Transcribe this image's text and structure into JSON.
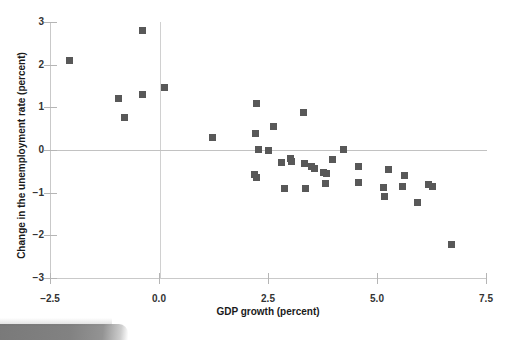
{
  "chart_data": {
    "type": "scatter",
    "title": "",
    "xlabel": "GDP growth (percent)",
    "ylabel": "Change in the unemployment rate (percent)",
    "xlim": [
      -2.5,
      7.5
    ],
    "ylim": [
      -3,
      3
    ],
    "xticks": [
      "-2.5",
      "0.0",
      "2.5",
      "5.0",
      "7.5"
    ],
    "xtick_values": [
      -2.5,
      0.0,
      2.5,
      5.0,
      7.5
    ],
    "yticks": [
      "3",
      "2",
      "1",
      "0",
      "-1",
      "-2",
      "-3"
    ],
    "ytick_values": [
      3,
      2,
      1,
      0,
      -1,
      -2,
      -3
    ],
    "grid": false,
    "legend": "none",
    "marker_color": "#585858",
    "marker_shape": "square",
    "reference_lines": [
      {
        "orientation": "horizontal",
        "value": 0
      },
      {
        "orientation": "vertical",
        "value": 0
      }
    ],
    "points": [
      {
        "x": -2.05,
        "y": 2.1
      },
      {
        "x": -0.93,
        "y": 1.21
      },
      {
        "x": -0.8,
        "y": 0.76
      },
      {
        "x": -0.38,
        "y": 2.79
      },
      {
        "x": -0.37,
        "y": 1.31
      },
      {
        "x": 0.13,
        "y": 1.47
      },
      {
        "x": 1.22,
        "y": 0.29
      },
      {
        "x": 2.23,
        "y": 1.1
      },
      {
        "x": 2.22,
        "y": 0.38
      },
      {
        "x": 2.28,
        "y": 0.02
      },
      {
        "x": 2.2,
        "y": -0.58
      },
      {
        "x": 2.23,
        "y": -0.65
      },
      {
        "x": 2.5,
        "y": -0.02
      },
      {
        "x": 2.63,
        "y": 0.56
      },
      {
        "x": 2.8,
        "y": -0.3
      },
      {
        "x": 2.88,
        "y": -0.9
      },
      {
        "x": 3.02,
        "y": -0.2
      },
      {
        "x": 3.05,
        "y": -0.27
      },
      {
        "x": 3.32,
        "y": 0.89
      },
      {
        "x": 3.33,
        "y": -0.31
      },
      {
        "x": 3.35,
        "y": -0.9
      },
      {
        "x": 3.5,
        "y": -0.38
      },
      {
        "x": 3.56,
        "y": -0.43
      },
      {
        "x": 3.78,
        "y": -0.52
      },
      {
        "x": 3.85,
        "y": -0.56
      },
      {
        "x": 3.83,
        "y": -0.78
      },
      {
        "x": 3.98,
        "y": -0.22
      },
      {
        "x": 4.23,
        "y": 0.01
      },
      {
        "x": 4.57,
        "y": -0.39
      },
      {
        "x": 4.58,
        "y": -0.76
      },
      {
        "x": 5.15,
        "y": -0.88
      },
      {
        "x": 5.17,
        "y": -1.09
      },
      {
        "x": 5.27,
        "y": -0.46
      },
      {
        "x": 5.58,
        "y": -0.86
      },
      {
        "x": 5.63,
        "y": -0.6
      },
      {
        "x": 5.92,
        "y": -1.24
      },
      {
        "x": 6.18,
        "y": -0.8
      },
      {
        "x": 6.28,
        "y": -0.86
      },
      {
        "x": 6.72,
        "y": -2.21
      }
    ]
  },
  "figure": {
    "artifact_label": "scan-edge-artifact"
  }
}
